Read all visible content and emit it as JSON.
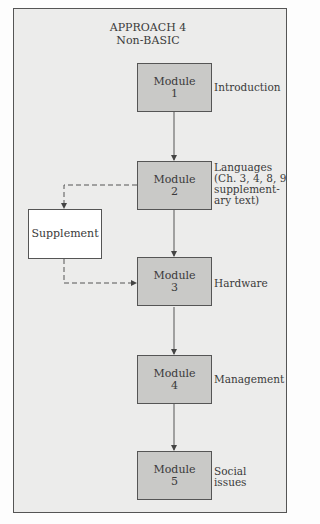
{
  "title": {
    "line1": "APPROACH 4",
    "line2": "Non-BASIC"
  },
  "modules": [
    {
      "name": "Module",
      "number": "1",
      "label": [
        "Introduction"
      ]
    },
    {
      "name": "Module",
      "number": "2",
      "label": [
        "Languages",
        "(Ch. 3, 4, 8, 9",
        "supplement-",
        "ary text)"
      ]
    },
    {
      "name": "Module",
      "number": "3",
      "label": [
        "Hardware"
      ]
    },
    {
      "name": "Module",
      "number": "4",
      "label": [
        "Management"
      ]
    },
    {
      "name": "Module",
      "number": "5",
      "label": [
        "Social",
        "issues"
      ]
    }
  ],
  "supplement": {
    "label": "Supplement"
  },
  "colors": {
    "frame_bg": "#ececeb",
    "module_fill": "#c9c9c7",
    "supplement_fill": "#ffffff",
    "line": "#555555"
  }
}
